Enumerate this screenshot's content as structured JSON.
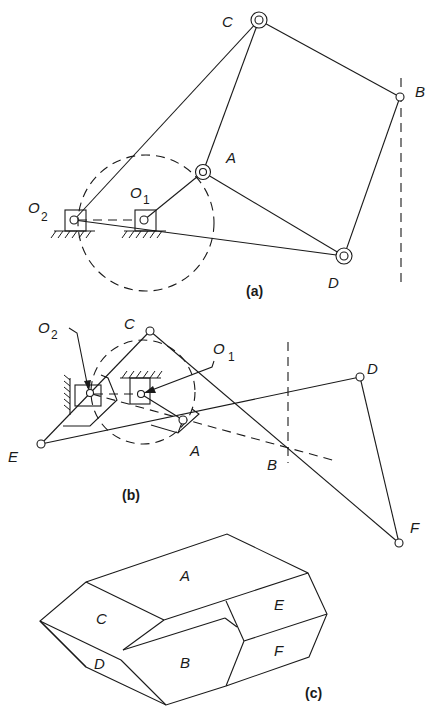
{
  "figure": {
    "panels": [
      {
        "id": "a",
        "caption": "(a)",
        "labels": {
          "C": "C",
          "B": "B",
          "A": "A",
          "D": "D",
          "O2": "O",
          "O2_sub": "2",
          "O1": "O",
          "O1_sub": "1"
        },
        "nodes": {
          "O2": [
            74,
            220
          ],
          "O1": [
            144,
            220
          ],
          "A": [
            203,
            172
          ],
          "C": [
            259,
            20
          ],
          "B": [
            400,
            97
          ],
          "D": [
            344,
            256
          ]
        },
        "links": [
          [
            "O2",
            "C"
          ],
          [
            "O1",
            "A"
          ],
          [
            "A",
            "C"
          ],
          [
            "C",
            "B"
          ],
          [
            "B",
            "D"
          ],
          [
            "A",
            "D"
          ],
          [
            "O2",
            "D"
          ]
        ],
        "dashed": {
          "circle_center": [
            146,
            223
          ],
          "circle_radius": 68,
          "guide_x": 401
        }
      },
      {
        "id": "b",
        "caption": "(b)",
        "labels": {
          "C": "C",
          "A": "A",
          "E": "E",
          "D": "D",
          "B": "B",
          "F": "F",
          "O2": "O",
          "O2_sub": "2",
          "O1": "O",
          "O1_sub": "1"
        },
        "nodes": {
          "O2": [
            90,
            393
          ],
          "O1": [
            141,
            394
          ],
          "C": [
            150,
            331
          ],
          "A": [
            183,
            420
          ],
          "E": [
            41,
            444
          ],
          "D": [
            360,
            377
          ],
          "F": [
            399,
            543
          ],
          "B": [
            288,
            448
          ]
        },
        "links": [
          [
            "E",
            "C"
          ],
          [
            "C",
            "F"
          ],
          [
            "E",
            "D"
          ],
          [
            "D",
            "F"
          ],
          [
            "O1",
            "A"
          ]
        ],
        "dashed": {
          "circle_center": [
            143,
            392
          ],
          "circle_radius": 52,
          "guide_x": 288
        }
      },
      {
        "id": "c",
        "caption": "(c)",
        "faces": [
          "A",
          "B",
          "C",
          "D",
          "E",
          "F"
        ]
      }
    ]
  }
}
